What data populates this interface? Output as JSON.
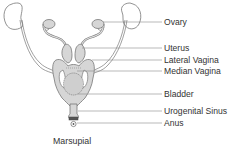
{
  "title": "Marsupial",
  "labels": [
    {
      "id": "ovary",
      "text": "Ovary",
      "y": 22
    },
    {
      "id": "uterus",
      "text": "Uterus",
      "y": 48
    },
    {
      "id": "lateral-vagina",
      "text": "Lateral Vagina",
      "y": 60
    },
    {
      "id": "median-vagina",
      "text": "Median Vagina",
      "y": 71
    },
    {
      "id": "bladder",
      "text": "Bladder",
      "y": 94
    },
    {
      "id": "urogenital-sinus",
      "text": "Urogenital Sinus",
      "y": 111
    },
    {
      "id": "anus",
      "text": "Anus",
      "y": 123
    }
  ],
  "colors": {
    "outline": "#777777",
    "fill": "#d6d6d6",
    "leader": "#8a8a8a",
    "text": "#333333"
  }
}
